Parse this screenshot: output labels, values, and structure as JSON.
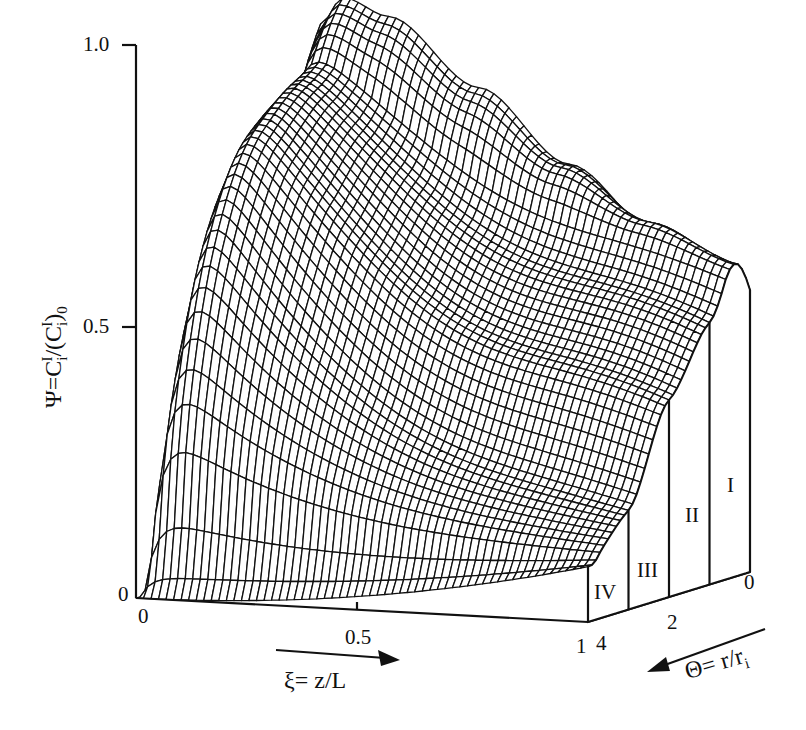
{
  "chart_data": {
    "type": "surface-3d-wireframe",
    "title": "",
    "zlabel": "Ψ=C_i^I/(C_i^I)_0",
    "xlabel": "ξ= z/L",
    "ylabel": "Θ= r/r_i",
    "z_ticks": [
      "0",
      "0.5",
      "1.0"
    ],
    "x_ticks": [
      "0",
      "0.5",
      "1"
    ],
    "y_ticks": [
      "0",
      "2",
      "4"
    ],
    "zlim": [
      0,
      1.0
    ],
    "xlim": [
      0,
      1
    ],
    "ylim": [
      0,
      4
    ],
    "regions": [
      "I",
      "II",
      "III",
      "IV"
    ],
    "right_face_profile": {
      "theta": [
        0,
        1,
        2,
        3,
        4
      ],
      "psi_at_xi_1": [
        0.51,
        0.34,
        0.26,
        0.12,
        0.1
      ]
    },
    "back_edge_profile": {
      "xi": [
        0,
        0.05,
        0.1,
        0.2,
        0.4,
        0.6,
        0.8,
        1.0
      ],
      "psi_at_theta_0": [
        0.0,
        0.95,
        1.0,
        0.97,
        0.85,
        0.72,
        0.6,
        0.51
      ]
    },
    "grid": {
      "nx": 60,
      "ny": 40
    }
  },
  "labels": {
    "y_axis_title_main": "Ψ=C",
    "y_axis_title_sub1": "i",
    "y_axis_title_sup1": "I",
    "y_axis_title_mid": "/(C",
    "y_axis_title_sub2": "i",
    "y_axis_title_sup2": "I",
    "y_axis_title_end": ")",
    "y_axis_title_sub3": "0",
    "tick_z_0": "0",
    "tick_z_05": "0.5",
    "tick_z_1": "1.0",
    "tick_x_0": "0",
    "tick_x_05": "0.5",
    "tick_x_1": "1",
    "tick_t_4": "4",
    "tick_t_2": "2",
    "tick_t_0": "0",
    "xi_label": "ξ= z/L",
    "theta_label_main": "Θ= r/r",
    "theta_label_sub": "i",
    "region_I": "I",
    "region_II": "II",
    "region_III": "III",
    "region_IV": "IV"
  }
}
